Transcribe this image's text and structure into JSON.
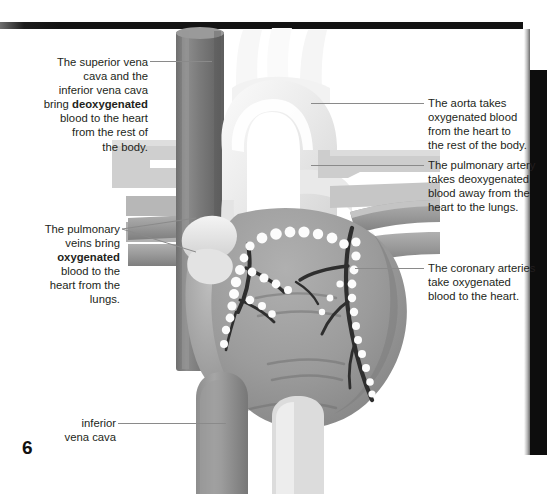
{
  "page": {
    "number": "6",
    "background_color": "#ffffff",
    "edge_bar_color": "#121212"
  },
  "figure": {
    "colors": {
      "aorta": "#efefef",
      "heart_muscle": "#9a9a9a",
      "vena_cava": "#7d7d7d",
      "pulmonary_vessel": "#b4b4b4",
      "coronary_artery": "#2f2f2f",
      "fat_globule": "#fdfdfd",
      "leader_line": "#8a8a8a"
    },
    "structures": [
      "superior vena cava",
      "aortic arch",
      "aorta",
      "pulmonary artery",
      "pulmonary veins",
      "coronary arteries",
      "inferior vena cava",
      "right ventricle",
      "left ventricle"
    ]
  },
  "annotations": {
    "superior_vena_cava": {
      "line1": "The superior vena",
      "line2": "cava and the",
      "line3": "inferior vena cava",
      "line4_pre": "bring ",
      "line4_bold": "deoxygenated",
      "line5": "blood to the heart",
      "line6": "from the rest of",
      "line7": "the body."
    },
    "pulmonary_veins": {
      "line1": "The pulmonary",
      "line2": "veins bring",
      "line3_bold": "oxygenated",
      "line4": "blood to the",
      "line5": "heart from the",
      "line6": "lungs."
    },
    "inferior_vena_cava": {
      "line1": "inferior",
      "line2": "vena cava"
    },
    "aorta": {
      "line1": "The aorta takes",
      "line2": "oxygenated blood",
      "line3": "from the heart to",
      "line4": "the rest of the body."
    },
    "pulmonary_artery": {
      "line1": "The pulmonary artery",
      "line2": "takes deoxygenated",
      "line3": "blood away from the",
      "line4": "heart to the lungs."
    },
    "coronary_arteries": {
      "line1": "The coronary arteries",
      "line2": "take oxygenated",
      "line3": "blood to the heart."
    }
  }
}
